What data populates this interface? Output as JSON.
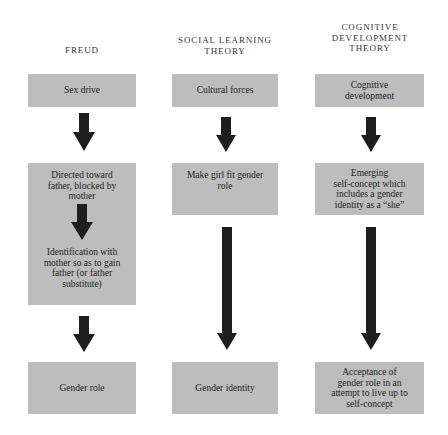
{
  "columns": [
    {
      "heading": "FREUD",
      "boxes": [
        "Sex drive",
        "Directed toward\nfather, blocked by\nmother",
        "Identification with\nmother so as to gain\nfather (or father\nsubstitute)",
        "Gender role"
      ]
    },
    {
      "heading": "SOCIAL  LEARNING\nTHEORY",
      "boxes": [
        "Cultural forces",
        "Make girl fit gender\nrole",
        "Gender identity"
      ]
    },
    {
      "heading": "COGNITIVE\nDEVELOPMENT\nTHEORY",
      "boxes": [
        "Cognitive\ndevelopment",
        "Emerging\nself-concept which\nincludes a gender\nidentity as a “she”",
        "Acceptance of\ngender role in an\nattempt to live up to\nself-concept"
      ]
    }
  ],
  "colors": {
    "box_fill": "#bdbdbd",
    "arrow_fill": "#1e1e1e",
    "text": "#222222",
    "background": "#ffffff"
  }
}
